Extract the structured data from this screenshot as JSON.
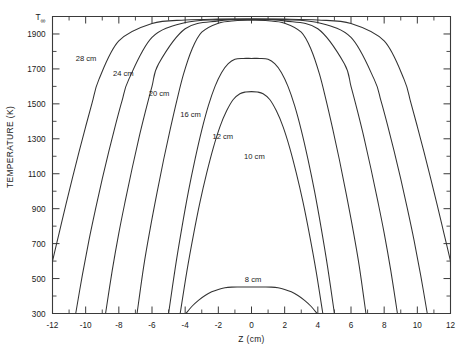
{
  "chart_data": {
    "type": "line",
    "title": "",
    "xlabel": "Z (cm)",
    "ylabel": "TEMPERATURE (K)",
    "xlim": [
      -12,
      12
    ],
    "ylim": [
      300,
      2000
    ],
    "grid": false,
    "legend_position": "inline-curve-labels",
    "x_ticks": [
      -12,
      -10,
      -8,
      -6,
      -4,
      -2,
      0,
      2,
      4,
      6,
      8,
      10,
      12
    ],
    "x_tick_labels": [
      "-12",
      "-10",
      "-8",
      "-6",
      "-4",
      "-2",
      "0",
      "2",
      "4",
      "6",
      "8",
      "10",
      "12"
    ],
    "x_minor_step": 1,
    "y_ticks": [
      300,
      500,
      700,
      900,
      1100,
      1300,
      1500,
      1700,
      1900,
      2000
    ],
    "y_tick_labels": [
      "300",
      "500",
      "700",
      "900",
      "1100",
      "1300",
      "1500",
      "1700",
      "1900",
      "T∞"
    ],
    "y_minor_step": 100,
    "top_label": "T∞",
    "top_label_base": "T",
    "top_label_sub": "∞",
    "plateau_value": 1985,
    "series": [
      {
        "name": "28 cm",
        "label": "28 cm",
        "label_x": -10.6,
        "label_y": 1745,
        "half_width": 14.0,
        "peak": 1985,
        "plateau_half": 9.2,
        "base": 300,
        "x": [
          -12.6,
          -12.3,
          -12.0,
          -11.6,
          -11.2,
          -10.8,
          -10.4,
          -10.0,
          -9.6,
          -9.2,
          -8.0,
          -6.0,
          -4.0,
          -2.0,
          0,
          2.0,
          4.0,
          6.0,
          8.0,
          9.2,
          9.6,
          10.0,
          10.4,
          10.8,
          11.2,
          11.6,
          12.0,
          12.3,
          12.6
        ],
        "y": [
          300,
          470,
          600,
          760,
          920,
          1075,
          1225,
          1370,
          1510,
          1640,
          1860,
          1960,
          1980,
          1985,
          1985,
          1985,
          1980,
          1960,
          1860,
          1640,
          1510,
          1370,
          1225,
          1075,
          920,
          760,
          600,
          470,
          300
        ]
      },
      {
        "name": "24 cm",
        "label": "24 cm",
        "label_x": -8.35,
        "label_y": 1660,
        "half_width": 12.0,
        "peak": 1985,
        "plateau_half": 7.6,
        "base": 300,
        "x": [
          -10.6,
          -10.2,
          -9.8,
          -9.4,
          -9.0,
          -8.6,
          -8.2,
          -7.8,
          -7.4,
          -6.0,
          -4.0,
          -2.0,
          0,
          2.0,
          4.0,
          6.0,
          7.4,
          7.8,
          8.2,
          8.6,
          9.0,
          9.4,
          9.8,
          10.2,
          10.6
        ],
        "y": [
          300,
          520,
          720,
          900,
          1070,
          1230,
          1380,
          1520,
          1640,
          1880,
          1965,
          1982,
          1985,
          1982,
          1965,
          1880,
          1640,
          1520,
          1380,
          1230,
          1070,
          900,
          720,
          520,
          300
        ]
      },
      {
        "name": "20 cm",
        "label": "20 cm",
        "label_x": -6.2,
        "label_y": 1545,
        "half_width": 9.9,
        "peak": 1983,
        "plateau_half": 5.6,
        "base": 300,
        "x": [
          -8.8,
          -8.4,
          -8.0,
          -7.6,
          -7.2,
          -6.8,
          -6.4,
          -6.0,
          -5.6,
          -4.0,
          -2.0,
          0,
          2.0,
          4.0,
          5.6,
          6.0,
          6.4,
          6.8,
          7.2,
          7.6,
          8.0,
          8.4,
          8.8
        ],
        "y": [
          300,
          545,
          760,
          950,
          1130,
          1300,
          1455,
          1600,
          1730,
          1930,
          1975,
          1983,
          1975,
          1930,
          1730,
          1600,
          1455,
          1300,
          1130,
          950,
          760,
          545,
          300
        ]
      },
      {
        "name": "16 cm",
        "label": "16 cm",
        "label_x": -4.3,
        "label_y": 1425,
        "half_width": 7.9,
        "peak": 1978,
        "plateau_half": 3.3,
        "base": 300,
        "x": [
          -6.9,
          -6.5,
          -6.1,
          -5.7,
          -5.3,
          -4.9,
          -4.5,
          -4.1,
          -3.6,
          -3.0,
          -2.0,
          -1.0,
          0,
          1.0,
          2.0,
          3.0,
          3.6,
          4.1,
          4.5,
          4.9,
          5.3,
          5.7,
          6.1,
          6.5,
          6.9
        ],
        "y": [
          300,
          570,
          790,
          990,
          1180,
          1355,
          1520,
          1670,
          1810,
          1910,
          1962,
          1976,
          1978,
          1976,
          1962,
          1910,
          1810,
          1670,
          1520,
          1355,
          1180,
          990,
          790,
          570,
          300
        ]
      },
      {
        "name": "12 cm",
        "label": "12 cm",
        "label_x": -2.35,
        "label_y": 1300,
        "half_width": 6.0,
        "peak": 1760,
        "plateau_half": 0,
        "base": 300,
        "x": [
          -5.0,
          -4.6,
          -4.2,
          -3.8,
          -3.4,
          -3.0,
          -2.6,
          -2.2,
          -1.8,
          -1.4,
          -1.0,
          -0.5,
          0,
          0.5,
          1.0,
          1.4,
          1.8,
          2.2,
          2.6,
          3.0,
          3.4,
          3.8,
          4.2,
          4.6,
          5.0
        ],
        "y": [
          300,
          560,
          790,
          1000,
          1185,
          1350,
          1490,
          1600,
          1680,
          1730,
          1755,
          1760,
          1760,
          1760,
          1755,
          1730,
          1680,
          1600,
          1490,
          1350,
          1185,
          1000,
          790,
          560,
          300
        ]
      },
      {
        "name": "10 cm",
        "label": "10 cm",
        "label_x": -0.45,
        "label_y": 1185,
        "half_width": 5.0,
        "peak": 1570,
        "plateau_half": 0,
        "base": 300,
        "x": [
          -4.3,
          -3.9,
          -3.5,
          -3.1,
          -2.7,
          -2.3,
          -1.9,
          -1.5,
          -1.1,
          -0.7,
          -0.35,
          0,
          0.35,
          0.7,
          1.1,
          1.5,
          1.9,
          2.3,
          2.7,
          3.1,
          3.5,
          3.9,
          4.3
        ],
        "y": [
          300,
          540,
          750,
          940,
          1105,
          1250,
          1370,
          1460,
          1525,
          1558,
          1568,
          1570,
          1568,
          1558,
          1525,
          1460,
          1370,
          1250,
          1105,
          940,
          750,
          540,
          300
        ]
      },
      {
        "name": "8 cm",
        "label": "8 cm",
        "label_x": -0.4,
        "label_y": 480,
        "half_width": 3.95,
        "peak": 452,
        "plateau_half": 0,
        "base": 300,
        "x": [
          -3.95,
          -3.6,
          -3.2,
          -2.8,
          -2.4,
          -2.0,
          -1.6,
          -1.2,
          -0.8,
          -0.4,
          0,
          0.4,
          0.8,
          1.2,
          1.6,
          2.0,
          2.4,
          2.8,
          3.2,
          3.6,
          3.95
        ],
        "y": [
          300,
          340,
          375,
          403,
          424,
          438,
          447,
          451,
          452,
          452,
          452,
          452,
          452,
          451,
          447,
          438,
          424,
          403,
          375,
          340,
          300
        ]
      }
    ]
  }
}
